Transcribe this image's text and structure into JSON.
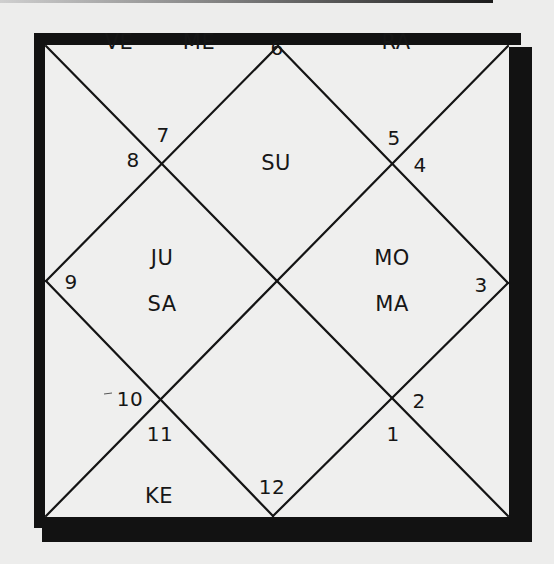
{
  "chart": {
    "type": "north-indian-kundli",
    "houses": [
      {
        "number": "1",
        "planets": []
      },
      {
        "number": "2",
        "planets": []
      },
      {
        "number": "3",
        "planets": [
          "MO",
          "MA"
        ]
      },
      {
        "number": "4",
        "planets": []
      },
      {
        "number": "5",
        "planets": [
          "RA"
        ]
      },
      {
        "number": "6",
        "planets": [
          "SU"
        ]
      },
      {
        "number": "7",
        "planets": [
          "VE",
          "ME"
        ]
      },
      {
        "number": "8",
        "planets": []
      },
      {
        "number": "9",
        "planets": [
          "JU",
          "SA"
        ]
      },
      {
        "number": "10",
        "planets": []
      },
      {
        "number": "11",
        "planets": [
          "KE"
        ]
      },
      {
        "number": "12",
        "planets": []
      }
    ]
  },
  "numbers": {
    "n1": "1",
    "n2": "2",
    "n3": "3",
    "n4": "4",
    "n5": "5",
    "n6": "6",
    "n7": "7",
    "n8": "8",
    "n9": "9",
    "n10": "10",
    "n11": "11",
    "n12": "12"
  },
  "planets": {
    "ve": "VE",
    "me": "ME",
    "ra": "RA",
    "su": "SU",
    "ju": "JU",
    "sa": "SA",
    "mo": "MO",
    "ma": "MA",
    "ke": "KE"
  },
  "colors": {
    "ink": "#121212",
    "paper": "#ededec"
  }
}
